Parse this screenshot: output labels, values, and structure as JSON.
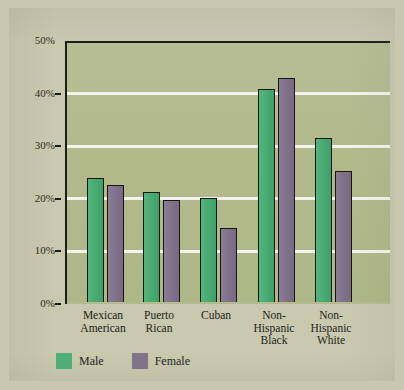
{
  "chart_data": {
    "type": "bar",
    "title": "",
    "xlabel": "",
    "ylabel": "",
    "ylim": [
      0,
      50
    ],
    "yticks": [
      0,
      10,
      20,
      30,
      40,
      50
    ],
    "ytick_labels": [
      "0%",
      "10%",
      "20%",
      "30%",
      "40%",
      "50%"
    ],
    "grid": true,
    "legend_position": "bottom-left",
    "categories": [
      "Mexican American",
      "Puerto Rican",
      "Cuban",
      "Non-Hispanic Black",
      "Non-Hispanic White"
    ],
    "category_lines": [
      [
        "Mexican",
        "American"
      ],
      [
        "Puerto",
        "Rican"
      ],
      [
        "Cuban"
      ],
      [
        "Non-",
        "Hispanic",
        "Black"
      ],
      [
        "Non-",
        "Hispanic",
        "White"
      ]
    ],
    "series": [
      {
        "name": "Male",
        "color": "#4fae78",
        "values": [
          24.0,
          21.3,
          20.2,
          40.9,
          31.6
        ]
      },
      {
        "name": "Female",
        "color": "#80738b",
        "values": [
          22.6,
          19.8,
          14.5,
          43.0,
          25.3
        ]
      }
    ]
  },
  "legend": {
    "items": [
      {
        "label": "Male",
        "swatch": "male-color-swatch"
      },
      {
        "label": "Female",
        "swatch": "female-color-swatch"
      }
    ]
  },
  "colors": {
    "page_background": "#c8c9ae",
    "plot_background": "#b3bb8e",
    "gridline": "#f4f4ee",
    "axis": "#1d1d18",
    "male_bar": "#4fae78",
    "female_bar": "#80738b",
    "text": "#22221b"
  }
}
